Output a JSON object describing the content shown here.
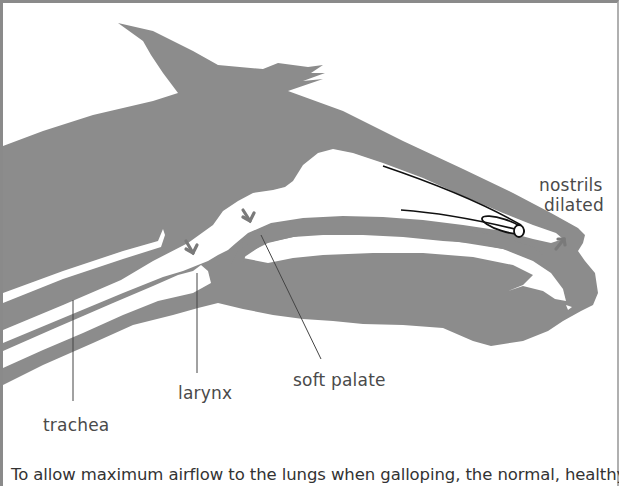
{
  "figure": {
    "type": "anatomical cross-section",
    "colors": {
      "tissue": "#8c8c8c",
      "airway": "#ffffff",
      "labels": "#4a4a4a",
      "leader_lines": "#555555",
      "arrows": "#7a7a7a",
      "frame": "#8a8a8a"
    }
  },
  "labels": {
    "nostrils_line1": "nostrils",
    "nostrils_line2": "dilated",
    "larynx": "larynx",
    "soft_palate": "soft palate",
    "trachea": "trachea"
  },
  "caption": "To allow maximum airflow to the lungs when galloping, the normal, healthy horse extends"
}
